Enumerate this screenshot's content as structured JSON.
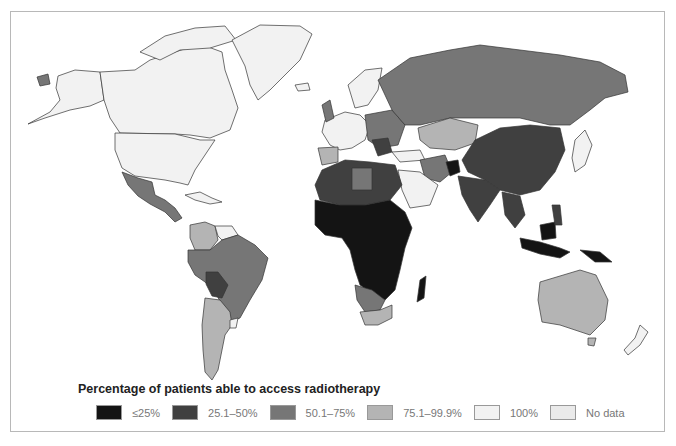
{
  "legend": {
    "title": "Percentage of patients able to access radiotherapy",
    "items": [
      {
        "label": "≤25%",
        "color": "#141414"
      },
      {
        "label": "25.1–50%",
        "color": "#404040"
      },
      {
        "label": "50.1–75%",
        "color": "#767676"
      },
      {
        "label": "75.1–99.9%",
        "color": "#b4b4b4"
      },
      {
        "label": "100%",
        "color": "#f2f2f2"
      },
      {
        "label": "No data",
        "color": "#eaeaea"
      }
    ]
  },
  "regions": [
    {
      "name": "North America (USA, Canada)",
      "category": "100%"
    },
    {
      "name": "Greenland",
      "category": "100%"
    },
    {
      "name": "Mexico & Central America",
      "category": "50.1–75%"
    },
    {
      "name": "Brazil & northern South America",
      "category": "50.1–75%"
    },
    {
      "name": "Bolivia",
      "category": "25.1–50%"
    },
    {
      "name": "Argentina & Chile",
      "category": "75.1–99.9%"
    },
    {
      "name": "Colombia/Venezuela",
      "category": "75.1–99.9%"
    },
    {
      "name": "Western Europe",
      "category": "100%"
    },
    {
      "name": "Eastern Europe",
      "category": "50.1–75%"
    },
    {
      "name": "Russia",
      "category": "50.1–75%"
    },
    {
      "name": "Kazakhstan",
      "category": "75.1–99.9%"
    },
    {
      "name": "China",
      "category": "25.1–50%"
    },
    {
      "name": "India",
      "category": "25.1–50%"
    },
    {
      "name": "Afghanistan",
      "category": "≤25%"
    },
    {
      "name": "Arabian Peninsula",
      "category": "100%"
    },
    {
      "name": "North Africa",
      "category": "25.1–50%"
    },
    {
      "name": "Sub-Saharan Africa",
      "category": "≤25%"
    },
    {
      "name": "Namibia/Botswana",
      "category": "50.1–75%"
    },
    {
      "name": "South Africa",
      "category": "75.1–99.9%"
    },
    {
      "name": "Southeast Asia",
      "category": "25.1–50%"
    },
    {
      "name": "Indonesia / Papua New Guinea",
      "category": "≤25%"
    },
    {
      "name": "Australia",
      "category": "75.1–99.9%"
    },
    {
      "name": "New Zealand",
      "category": "100%"
    }
  ]
}
